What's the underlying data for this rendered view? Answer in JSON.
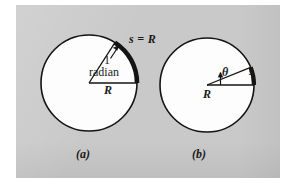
{
  "figure": {
    "background_color": "#c9c9c9",
    "page_color": "#ffffff",
    "ink_color": "#141414",
    "circle_fill": "#fdfdfd",
    "panels": [
      {
        "id": "a",
        "caption": "(a)",
        "center_x": 89,
        "center_y": 83,
        "radius": 48,
        "angle_deg": 57.3,
        "arc_label": "s = R",
        "angle_label_line1": "1",
        "angle_label_line2": "radian",
        "radius_label": "R"
      },
      {
        "id": "b",
        "caption": "(b)",
        "center_x": 207,
        "center_y": 85,
        "radius": 47,
        "angle_deg": 22,
        "arc_label": "s",
        "angle_label": "θ",
        "radius_label": "R"
      }
    ]
  },
  "labels": {
    "s_equals_r": "s = R",
    "one": "1",
    "radian": "radian",
    "radius_a": "R",
    "theta": "θ",
    "arc_s": "s",
    "radius_b": "R",
    "caption_a": "(a)",
    "caption_b": "(b)"
  }
}
